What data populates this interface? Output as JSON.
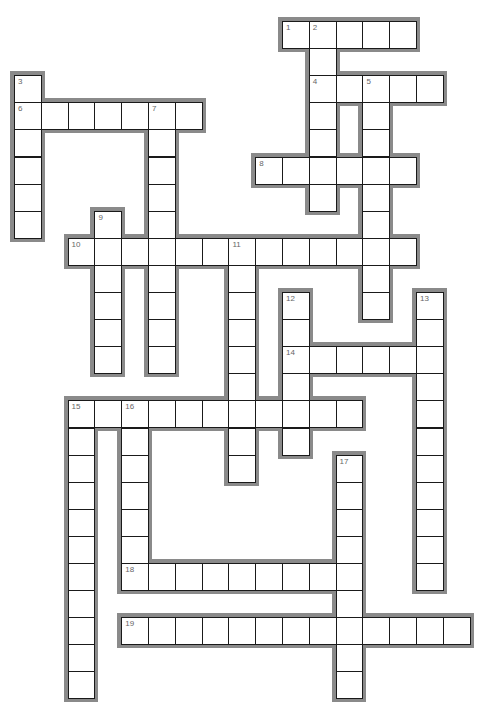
{
  "puzzle": {
    "type": "crossword",
    "grid": {
      "origin_x": 14,
      "origin_y": 21,
      "cell_w": 26.8,
      "cell_h": 27.1,
      "border_color": "#8a8a8a",
      "line_color": "#1a1a1a",
      "number_color": "#666666"
    },
    "words": [
      {
        "number": "1",
        "direction": "across",
        "row": 0,
        "col": 10,
        "length": 5
      },
      {
        "number": "2",
        "direction": "down",
        "row": 0,
        "col": 11,
        "length": 7
      },
      {
        "number": "3",
        "direction": "down",
        "row": 2,
        "col": 0,
        "length": 6
      },
      {
        "number": "4",
        "direction": "across",
        "row": 2,
        "col": 11,
        "length": 5
      },
      {
        "number": "5",
        "direction": "down",
        "row": 2,
        "col": 13,
        "length": 9
      },
      {
        "number": "6",
        "direction": "across",
        "row": 3,
        "col": 0,
        "length": 7
      },
      {
        "number": "7",
        "direction": "down",
        "row": 3,
        "col": 5,
        "length": 10
      },
      {
        "number": "8",
        "direction": "across",
        "row": 5,
        "col": 9,
        "length": 6
      },
      {
        "number": "9",
        "direction": "down",
        "row": 7,
        "col": 3,
        "length": 6
      },
      {
        "number": "10",
        "direction": "across",
        "row": 8,
        "col": 2,
        "length": 13
      },
      {
        "number": "11",
        "direction": "down",
        "row": 8,
        "col": 8,
        "length": 9
      },
      {
        "number": "12",
        "direction": "down",
        "row": 10,
        "col": 10,
        "length": 6
      },
      {
        "number": "13",
        "direction": "down",
        "row": 10,
        "col": 15,
        "length": 11
      },
      {
        "number": "14",
        "direction": "across",
        "row": 12,
        "col": 10,
        "length": 6
      },
      {
        "number": "15",
        "direction": "across",
        "row": 14,
        "col": 2,
        "length": 11
      },
      {
        "number": "15",
        "direction": "down",
        "row": 14,
        "col": 2,
        "length": 11
      },
      {
        "number": "16",
        "direction": "down",
        "row": 14,
        "col": 4,
        "length": 7
      },
      {
        "number": "17",
        "direction": "down",
        "row": 16,
        "col": 12,
        "length": 9
      },
      {
        "number": "18",
        "direction": "across",
        "row": 20,
        "col": 4,
        "length": 9
      },
      {
        "number": "19",
        "direction": "across",
        "row": 22,
        "col": 4,
        "length": 13
      }
    ]
  }
}
